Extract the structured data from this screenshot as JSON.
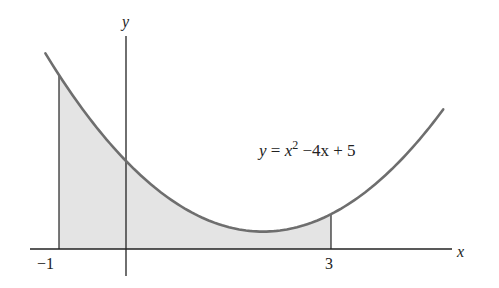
{
  "diagram": {
    "equation_label": "y = x² − 4x + 5",
    "equation_parts": {
      "y": "y",
      "eq": " = ",
      "x": "x",
      "exp": "2",
      "rest": " −4x + 5"
    },
    "x_axis_label": "x",
    "y_axis_label": "y",
    "tick_labels": [
      "−1",
      "3"
    ],
    "shaded_interval": [
      -1,
      3
    ],
    "function": {
      "a": 1,
      "b": -4,
      "c": 5
    },
    "plot_domain": [
      -1.2,
      4.65
    ],
    "colors": {
      "curve": "#6e6e6e",
      "fill": "#e4e4e4",
      "axis": "#222222"
    }
  }
}
